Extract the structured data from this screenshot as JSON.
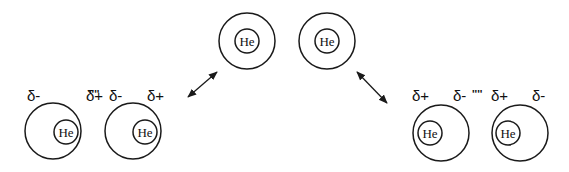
{
  "diagram": {
    "element_label": "He",
    "colors": {
      "stroke": "#1a1a1a",
      "background": "#ffffff",
      "text": "#111111"
    },
    "top_atoms": [
      {
        "cx": 247,
        "cy": 41,
        "r_outer": 28,
        "inner_cx": 247,
        "inner_cy": 41,
        "r_inner": 12,
        "label": "He"
      },
      {
        "cx": 327,
        "cy": 41,
        "r_outer": 28,
        "inner_cx": 327,
        "inner_cy": 41,
        "r_inner": 12,
        "label": "He"
      }
    ],
    "left_pair": {
      "atoms": [
        {
          "cx": 53,
          "cy": 131,
          "r_outer": 28,
          "inner_cx": 66,
          "inner_cy": 132,
          "r_inner": 12,
          "label": "He"
        },
        {
          "cx": 133,
          "cy": 131,
          "r_outer": 28,
          "inner_cx": 145,
          "inner_cy": 132,
          "r_inner": 12,
          "label": "He"
        }
      ],
      "charges": [
        "δ-",
        "δ+",
        "δ-",
        "δ+"
      ],
      "interaction": "''''"
    },
    "right_pair": {
      "atoms": [
        {
          "cx": 441,
          "cy": 133,
          "r_outer": 28,
          "inner_cx": 430,
          "inner_cy": 133,
          "r_inner": 12,
          "label": "He"
        },
        {
          "cx": 520,
          "cy": 133,
          "r_outer": 28,
          "inner_cx": 508,
          "inner_cy": 133,
          "r_inner": 12,
          "label": "He"
        }
      ],
      "charges": [
        "δ+",
        "δ-",
        "δ+",
        "δ-"
      ],
      "interaction": "''''"
    },
    "arrows": [
      {
        "name": "left-double-arrow",
        "x1": 217,
        "y1": 72,
        "x2": 188,
        "y2": 97
      },
      {
        "name": "right-double-arrow",
        "x1": 357,
        "y1": 72,
        "x2": 387,
        "y2": 103
      }
    ]
  }
}
